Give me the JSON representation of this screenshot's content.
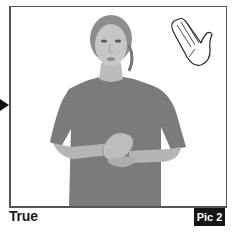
{
  "figure": {
    "caption": "True",
    "badge": "Pic 2",
    "pointer": "arrow-right-icon",
    "handshape_icon": "open-hand-icon",
    "colors": {
      "border": "#555555",
      "badge_bg": "#141414",
      "badge_text": "#ffffff",
      "shirt": "#7a7a7a",
      "skin": "#b8b8b8"
    }
  }
}
